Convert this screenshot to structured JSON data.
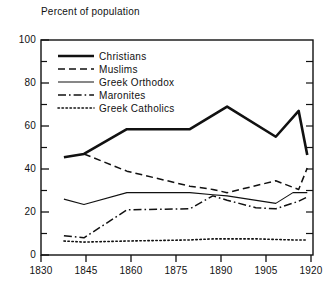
{
  "chart_data": {
    "type": "line",
    "title": "Percent of population",
    "xlabel": "",
    "ylabel": "Percent of population",
    "xlim": [
      1830,
      1925
    ],
    "ylim": [
      0,
      100
    ],
    "grid": false,
    "legend_position": "upper-left-inside",
    "x_ticks": [
      "1830",
      "1845",
      "1860",
      "1875",
      "1890",
      "1905",
      "1920"
    ],
    "x_tick_values": [
      1830,
      1845,
      1860,
      1875,
      1890,
      1905,
      1920
    ],
    "y_ticks": [
      "0",
      "20",
      "40",
      "60",
      "80",
      "100"
    ],
    "y_tick_values": [
      0,
      20,
      40,
      60,
      80,
      100
    ],
    "y_minor_ticks": [
      10,
      30,
      50,
      70,
      90
    ],
    "series": [
      {
        "name": "Christians",
        "style": "solid-thick",
        "x": [
          1838,
          1845,
          1860,
          1882,
          1895,
          1912,
          1920,
          1923
        ],
        "values": [
          45.5,
          47,
          58.5,
          58.5,
          69,
          55,
          67,
          46.5
        ]
      },
      {
        "name": "Muslims",
        "style": "dashed",
        "x": [
          1845,
          1860,
          1882,
          1890,
          1895,
          1912,
          1920,
          1923
        ],
        "values": [
          47,
          39,
          32,
          30.5,
          29,
          34.5,
          30.5,
          40.5
        ]
      },
      {
        "name": "Greek Orthodox",
        "style": "solid-thin",
        "x": [
          1838,
          1845,
          1860,
          1882,
          1890,
          1895,
          1912,
          1918,
          1923
        ],
        "values": [
          26,
          23.5,
          29,
          29,
          28,
          27.5,
          24,
          29,
          29
        ]
      },
      {
        "name": "Maronites",
        "style": "dash-dot",
        "x": [
          1838,
          1845,
          1860,
          1882,
          1890,
          1895,
          1905,
          1912,
          1920,
          1923
        ],
        "values": [
          9,
          8,
          21,
          21.5,
          27.5,
          25.5,
          22,
          21.5,
          25,
          27
        ]
      },
      {
        "name": "Greek Catholics",
        "style": "dotted",
        "x": [
          1838,
          1845,
          1860,
          1882,
          1890,
          1905,
          1918,
          1923
        ],
        "values": [
          6.5,
          6,
          6.5,
          7,
          7.5,
          7.5,
          7,
          7
        ]
      }
    ]
  },
  "legend": {
    "items": [
      {
        "label": "Christians",
        "style": "solid-thick"
      },
      {
        "label": "Muslims",
        "style": "dashed"
      },
      {
        "label": "Greek Orthodox",
        "style": "solid-thin"
      },
      {
        "label": "Maronites",
        "style": "dash-dot"
      },
      {
        "label": "Greek Catholics",
        "style": "dotted"
      }
    ]
  },
  "colors": {
    "ink": "#111111",
    "background": "#ffffff"
  }
}
